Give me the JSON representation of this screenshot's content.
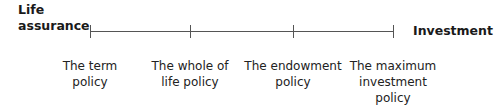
{
  "diagram": {
    "left_end_label": "Life\nassurance",
    "right_end_label": "Investment",
    "points": [
      {
        "label": "The term\npolicy",
        "x": 90
      },
      {
        "label": "The whole of\nlife policy",
        "x": 190
      },
      {
        "label": "The endowment\npolicy",
        "x": 293
      },
      {
        "label": "The maximum\ninvestment\npolicy",
        "x": 393
      }
    ],
    "colors": {
      "line": "#555555",
      "text": "#1a1a1a"
    }
  }
}
